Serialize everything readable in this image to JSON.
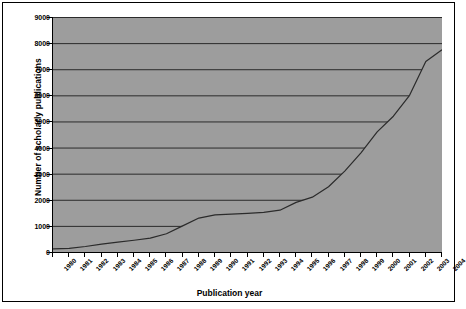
{
  "chart_data": {
    "type": "area",
    "title": "",
    "xlabel": "Publication year",
    "ylabel": "Number of scholarly publications",
    "xlim": [
      1980,
      2004
    ],
    "ylim": [
      0,
      9000
    ],
    "ytick_labels": [
      "0",
      "1000",
      "2000",
      "3000",
      "4000",
      "5000",
      "6000",
      "7000",
      "8000",
      "9000"
    ],
    "ytick_values": [
      0,
      1000,
      2000,
      3000,
      4000,
      5000,
      6000,
      7000,
      8000,
      9000
    ],
    "grid": "horizontal",
    "legend": "none",
    "categories": [
      "1980",
      "1981",
      "1982",
      "1983",
      "1984",
      "1985",
      "1986",
      "1987",
      "1988",
      "1989",
      "1990",
      "1991",
      "1992",
      "1993",
      "1994",
      "1995",
      "1996",
      "1997",
      "1998",
      "1999",
      "2000",
      "2001",
      "2002",
      "2003",
      "2004"
    ],
    "x": [
      1980,
      1981,
      1982,
      1983,
      1984,
      1985,
      1986,
      1987,
      1988,
      1989,
      1990,
      1991,
      1992,
      1993,
      1994,
      1995,
      1996,
      1997,
      1998,
      1999,
      2000,
      2001,
      2002,
      2003,
      2004
    ],
    "values": [
      120,
      140,
      210,
      300,
      380,
      450,
      530,
      700,
      1000,
      1300,
      1420,
      1450,
      1480,
      1520,
      1600,
      1900,
      2100,
      2500,
      3100,
      3800,
      4600,
      5200,
      6000,
      7300,
      7750
    ],
    "series": [
      {
        "name": "Number of scholarly publications",
        "values": [
          120,
          140,
          210,
          300,
          380,
          450,
          530,
          700,
          1000,
          1300,
          1420,
          1450,
          1480,
          1520,
          1600,
          1900,
          2100,
          2500,
          3100,
          3800,
          4600,
          5200,
          6000,
          7300,
          7750
        ]
      }
    ],
    "colors": {
      "plot_background": "#9d9d9d",
      "area_fill": "#9d9d9d",
      "line": "#2b2b2b",
      "gridline": "#2b2b2b",
      "axis": "#000000",
      "page_background": "#ffffff",
      "text": "#000000"
    }
  }
}
